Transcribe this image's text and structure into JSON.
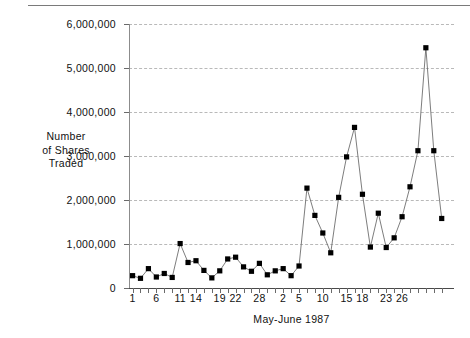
{
  "chart_data": {
    "type": "line",
    "title": "",
    "subtitle": "",
    "xlabel": "May-June 1987",
    "ylabel": "Number of Shares Traded",
    "ylabel_lines": [
      "Number",
      "of Shares",
      "Traded"
    ],
    "ylim": [
      0,
      6000000
    ],
    "ytick_values": [
      0,
      1000000,
      2000000,
      3000000,
      4000000,
      5000000,
      6000000
    ],
    "ytick_labels": [
      "0",
      "1,000,000",
      "2,000,000",
      "3,000,000",
      "4,000,000",
      "5,000,000",
      "6,000,000"
    ],
    "grid": "horizontal-dashed",
    "legend": "none",
    "marker": "filled-square",
    "marker_color": "#000000",
    "line_color": "#6e6e6e",
    "xlim": [
      0,
      39
    ],
    "x_index": [
      0,
      1,
      2,
      3,
      4,
      5,
      6,
      7,
      8,
      9,
      10,
      11,
      12,
      13,
      14,
      15,
      16,
      17,
      18,
      19,
      20,
      21,
      22,
      23,
      24,
      25,
      26,
      27,
      28,
      29,
      30,
      31,
      32,
      33,
      34,
      35,
      36,
      37,
      38,
      39
    ],
    "xtick_labels_sparse": [
      "1",
      "6",
      "11",
      "14",
      "19",
      "22",
      "28",
      "2",
      "5",
      "10",
      "15",
      "18",
      "23",
      "26"
    ],
    "xtick_label_index": [
      0,
      3,
      6,
      8,
      11,
      13,
      16,
      19,
      21,
      24,
      27,
      29,
      32,
      34
    ],
    "categories": [
      "1",
      "2",
      "3",
      "4",
      "5",
      "6",
      "7",
      "8",
      "9",
      "10",
      "11",
      "12",
      "13",
      "14",
      "15",
      "16",
      "17",
      "18",
      "19",
      "20",
      "21",
      "22",
      "23",
      "24",
      "25",
      "26",
      "27",
      "28",
      "29",
      "30",
      "31",
      "32",
      "33",
      "34",
      "35",
      "36",
      "37",
      "38",
      "39",
      "40"
    ],
    "values": [
      280000,
      220000,
      440000,
      250000,
      330000,
      240000,
      1010000,
      580000,
      620000,
      400000,
      230000,
      390000,
      660000,
      700000,
      480000,
      380000,
      560000,
      300000,
      390000,
      440000,
      280000,
      500000,
      2270000,
      1650000,
      1250000,
      800000,
      2060000,
      2980000,
      3650000,
      2130000,
      930000,
      1700000,
      920000,
      1140000,
      1620000,
      2300000,
      3120000,
      5460000,
      3120000,
      1580000
    ],
    "tail_values": [
      600000
    ]
  },
  "figure": {
    "top_rule": true,
    "background": "#ffffff",
    "text_color": "#111111",
    "grid_color": "#b9b9b9",
    "axis_color": "#4a4a4a"
  }
}
